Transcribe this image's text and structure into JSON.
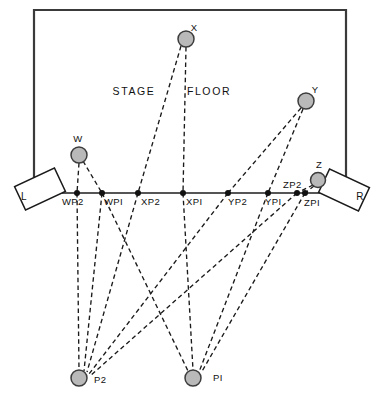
{
  "diagram": {
    "regions": [
      {
        "name": "stage-label",
        "text": "STAGE",
        "x": 134,
        "y": 95
      },
      {
        "name": "floor-label",
        "text": "FLOOR",
        "x": 209,
        "y": 95
      }
    ],
    "frame": {
      "x": 34,
      "y": 10,
      "width": 312,
      "height": 183,
      "stroke": "#3a3a3a",
      "stroke_width": 2.2
    },
    "baseline": {
      "x1": 20,
      "y1": 193,
      "x2": 357,
      "y2": 193,
      "stroke": "#555555",
      "stroke_width": 1.8
    },
    "colors": {
      "marker_fill": "#b9b9b9",
      "marker_stroke": "#3c3c3c",
      "dot": "#111111",
      "line": "#1a1a1a",
      "frame": "#3a3a3a",
      "baseline": "#555555"
    },
    "speakers": [
      {
        "name": "speaker-left",
        "label": "L",
        "cx": 40,
        "cy": 189,
        "w": 44,
        "h": 26,
        "rot": -25,
        "label_x": 24,
        "label_y": 200
      },
      {
        "name": "speaker-right",
        "label": "R",
        "cx": 344,
        "cy": 190,
        "w": 44,
        "h": 26,
        "rot": 25,
        "label_x": 360,
        "label_y": 200
      }
    ],
    "sources": [
      {
        "name": "source-w",
        "label": "W",
        "x": 79,
        "y": 155,
        "r": 8,
        "label_x": 78,
        "label_y": 142
      },
      {
        "name": "source-x",
        "label": "X",
        "x": 186,
        "y": 39,
        "r": 8,
        "label_x": 194,
        "label_y": 31
      },
      {
        "name": "source-y",
        "label": "Y",
        "x": 306,
        "y": 101,
        "r": 8,
        "label_x": 315,
        "label_y": 93
      },
      {
        "name": "source-z",
        "label": "Z",
        "x": 318,
        "y": 180,
        "r": 7.5,
        "label_x": 319,
        "label_y": 168
      }
    ],
    "listeners": [
      {
        "name": "listener-p2",
        "label": "P2",
        "x": 79,
        "y": 378,
        "r": 8,
        "label_x": 94,
        "label_y": 383
      },
      {
        "name": "listener-p1",
        "label": "PI",
        "x": 193,
        "y": 378,
        "r": 8,
        "label_x": 213,
        "label_y": 381
      }
    ],
    "image_points": [
      {
        "name": "point-wp2",
        "label": "WP2",
        "x": 77,
        "y": 193,
        "label_x": 62,
        "label_y": 205
      },
      {
        "name": "point-wpi",
        "label": "WPI",
        "x": 102,
        "y": 193,
        "label_x": 104,
        "label_y": 205
      },
      {
        "name": "point-xp2",
        "label": "XP2",
        "x": 138,
        "y": 193,
        "label_x": 141,
        "label_y": 205
      },
      {
        "name": "point-xpi",
        "label": "XPI",
        "x": 183,
        "y": 193,
        "label_x": 186,
        "label_y": 205
      },
      {
        "name": "point-yp2",
        "label": "YP2",
        "x": 228,
        "y": 193,
        "label_x": 228,
        "label_y": 205
      },
      {
        "name": "point-ypi",
        "label": "YPI",
        "x": 268,
        "y": 193,
        "label_x": 265,
        "label_y": 205
      },
      {
        "name": "point-zp2",
        "label": "ZP2",
        "x": 297,
        "y": 193,
        "label_x": 283,
        "label_y": 188
      },
      {
        "name": "point-zpi",
        "label": "ZPI",
        "x": 305,
        "y": 193,
        "label_x": 304,
        "label_y": 206
      }
    ],
    "rays": {
      "source_to_image": [
        {
          "name": "ray-w-wp2",
          "from": "W",
          "to": "WP2",
          "x1": 79,
          "y1": 163,
          "x2": 77,
          "y2": 193
        },
        {
          "name": "ray-w-wpi",
          "from": "W",
          "to": "WPI",
          "x1": 83,
          "y1": 161,
          "x2": 102,
          "y2": 193
        },
        {
          "name": "ray-x-xp2",
          "from": "X",
          "to": "XP2",
          "x1": 181,
          "y1": 46,
          "x2": 138,
          "y2": 193
        },
        {
          "name": "ray-x-xpi",
          "from": "X",
          "to": "XPI",
          "x1": 186,
          "y1": 47,
          "x2": 183,
          "y2": 193
        },
        {
          "name": "ray-y-yp2",
          "from": "Y",
          "to": "YP2",
          "x1": 301,
          "y1": 108,
          "x2": 228,
          "y2": 193
        },
        {
          "name": "ray-y-ypi",
          "from": "Y",
          "to": "YPI",
          "x1": 303,
          "y1": 109,
          "x2": 268,
          "y2": 193
        },
        {
          "name": "ray-z-zp2",
          "from": "Z",
          "to": "ZP2",
          "x1": 313,
          "y1": 185,
          "x2": 297,
          "y2": 193
        },
        {
          "name": "ray-z-zpi",
          "from": "Z",
          "to": "ZPI",
          "x1": 314,
          "y1": 186,
          "x2": 305,
          "y2": 193
        }
      ],
      "image_to_listener": [
        {
          "name": "ray-wp2-p2",
          "from": "WP2",
          "to": "P2",
          "x1": 77,
          "y1": 193,
          "x2": 79,
          "y2": 370
        },
        {
          "name": "ray-wpi-p2",
          "from": "WPI",
          "to": "P2",
          "x1": 102,
          "y1": 193,
          "x2": 84,
          "y2": 371
        },
        {
          "name": "ray-xp2-p2",
          "from": "XP2",
          "to": "P2",
          "x1": 138,
          "y1": 193,
          "x2": 87,
          "y2": 372
        },
        {
          "name": "ray-yp2-p2",
          "from": "YP2",
          "to": "P2",
          "x1": 228,
          "y1": 193,
          "x2": 89,
          "y2": 374
        },
        {
          "name": "ray-zp2-p2",
          "from": "ZP2",
          "to": "P2",
          "x1": 297,
          "y1": 193,
          "x2": 90,
          "y2": 376
        },
        {
          "name": "ray-xpi-p1",
          "from": "XPI",
          "to": "P1",
          "x1": 183,
          "y1": 193,
          "x2": 193,
          "y2": 370
        },
        {
          "name": "ray-ypi-p1",
          "from": "YPI",
          "to": "P1",
          "x1": 268,
          "y1": 193,
          "x2": 199,
          "y2": 372
        },
        {
          "name": "ray-zpi-p1",
          "from": "ZPI",
          "to": "P1",
          "x1": 305,
          "y1": 193,
          "x2": 201,
          "y2": 373
        },
        {
          "name": "ray-wpi-cross",
          "from": "WPI",
          "to": "P1-cross",
          "x1": 102,
          "y1": 193,
          "x2": 188,
          "y2": 371
        }
      ]
    }
  }
}
